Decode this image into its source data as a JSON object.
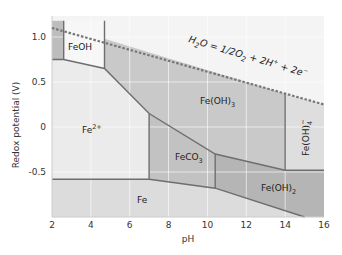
{
  "chart_data": {
    "type": "diagram",
    "title": "",
    "xlabel": "pH",
    "ylabel": "Redox potential (V)",
    "xlim": [
      2,
      16
    ],
    "ylim": [
      -1.0,
      1.2
    ],
    "x_ticks": [
      "2",
      "4",
      "6",
      "8",
      "10",
      "12",
      "14",
      "16"
    ],
    "y_ticks": [
      {
        "label": "1.0",
        "value": 1.0
      },
      {
        "label": "0.5",
        "value": 0.5
      },
      {
        "label": "0",
        "value": 0.0
      },
      {
        "label": "-0.5",
        "value": -0.5
      }
    ],
    "grid": true,
    "water_line": {
      "label": "H2O = 1/2O2 + 2H+ + 2e-",
      "points": [
        [
          2,
          1.1
        ],
        [
          16,
          0.25
        ]
      ],
      "style": "dashed"
    },
    "regions": [
      {
        "name": "Fe2+",
        "fill": "#ebebeb",
        "polygon": [
          [
            2,
            0.75
          ],
          [
            2.6,
            0.75
          ],
          [
            4.7,
            0.65
          ],
          [
            7.0,
            0.15
          ],
          [
            7.0,
            -0.58
          ],
          [
            2,
            -0.58
          ]
        ]
      },
      {
        "name": "FeOH",
        "fill": "#f7f7f7",
        "polygon": [
          [
            2.6,
            1.18
          ],
          [
            4.7,
            1.18
          ],
          [
            4.7,
            0.65
          ],
          [
            2.6,
            0.75
          ]
        ]
      },
      {
        "name": "Fe(OH)3",
        "fill": "#c9c9c9",
        "polygon": [
          [
            4.7,
            0.98
          ],
          [
            14.0,
            0.37
          ],
          [
            14.0,
            -0.48
          ],
          [
            10.4,
            -0.3
          ],
          [
            7.0,
            0.15
          ],
          [
            4.7,
            0.65
          ]
        ]
      },
      {
        "name": "FeCO3",
        "fill": "#c2c2c2",
        "polygon": [
          [
            7.0,
            0.15
          ],
          [
            10.4,
            -0.3
          ],
          [
            10.4,
            -0.68
          ],
          [
            7.0,
            -0.58
          ]
        ]
      },
      {
        "name": "Fe(OH)2",
        "fill": "#b5b5b5",
        "polygon": [
          [
            10.4,
            -0.3
          ],
          [
            14.0,
            -0.48
          ],
          [
            16.0,
            -0.48
          ],
          [
            16.0,
            -1.0
          ],
          [
            15.0,
            -1.0
          ],
          [
            10.4,
            -0.68
          ]
        ]
      },
      {
        "name": "Fe(OH)4-",
        "fill": "#dedede",
        "polygon": [
          [
            14.0,
            0.37
          ],
          [
            16.0,
            0.25
          ],
          [
            16.0,
            -0.48
          ],
          [
            14.0,
            -0.48
          ]
        ]
      },
      {
        "name": "Fe",
        "fill": "#dcdcdc",
        "polygon": [
          [
            2,
            -0.58
          ],
          [
            7.0,
            -0.58
          ],
          [
            10.4,
            -0.68
          ],
          [
            15.0,
            -1.0
          ],
          [
            2,
            -1.0
          ]
        ]
      },
      {
        "name": "Fe2+ (left sliver)",
        "fill": "#bdbdbd",
        "polygon": [
          [
            2,
            1.18
          ],
          [
            2.6,
            1.18
          ],
          [
            2.6,
            0.75
          ],
          [
            2,
            0.75
          ]
        ]
      }
    ],
    "region_labels": [
      {
        "text": "FeOH",
        "x": 3.6,
        "y": 0.88
      },
      {
        "text": "Fe2+",
        "x": 4.0,
        "y": 0.0
      },
      {
        "text": "Fe(OH)3",
        "x": 11.2,
        "y": 0.28
      },
      {
        "text": "FeCO3",
        "x": 8.4,
        "y": -0.38
      },
      {
        "text": "Fe(OH)2",
        "x": 13.5,
        "y": -0.72
      },
      {
        "text": "Fe(OH)4-",
        "x": 15.0,
        "y": -0.05,
        "rotated": true
      },
      {
        "text": "Fe",
        "x": 6.5,
        "y": -0.8
      }
    ]
  },
  "labels": {
    "xlabel": "pH",
    "ylabel": "Redox potential (V)",
    "water_eq_main": "H",
    "water_eq_sub2": "2",
    "water_eq_rest1": "O = 1/2O",
    "water_eq_sub2b": "2",
    "water_eq_rest2": " + 2H",
    "water_eq_sup_plus": "+",
    "water_eq_rest3": " + 2e",
    "water_eq_sup_minus": "−",
    "feoh": "FeOH",
    "fe2_base": "Fe",
    "fe2_sup": "2+",
    "feoh3_base": "Fe(OH)",
    "feoh3_sub": "3",
    "feco3_base": "FeCO",
    "feco3_sub": "3",
    "feoh2_base": "Fe(OH)",
    "feoh2_sub": "2",
    "feoh4_base": "Fe(OH)",
    "feoh4_sub": "4",
    "feoh4_sup": "−",
    "fe": "Fe"
  }
}
